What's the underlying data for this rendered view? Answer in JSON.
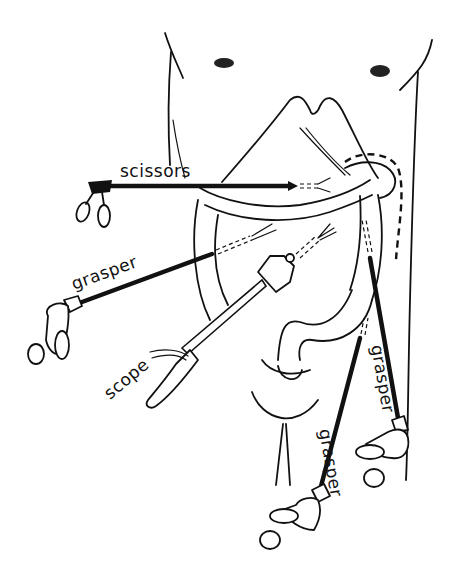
{
  "figure": {
    "labels": {
      "scissors": "scissors",
      "grasper_left": "grasper",
      "scope": "scope",
      "grasper_lower_right": "grasper",
      "grasper_right": "grasper"
    },
    "colors": {
      "line": "#111111",
      "background": "#ffffff"
    }
  }
}
